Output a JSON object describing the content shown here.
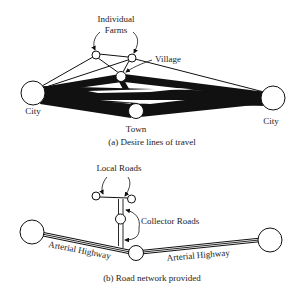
{
  "figure_a": {
    "caption": "(a) Desire lines of travel",
    "labels": {
      "individual_line1": "Individual",
      "individual_line2": "Farms",
      "village": "Village",
      "city_left": "City",
      "city_right": "City",
      "town": "Town"
    }
  },
  "figure_b": {
    "caption": "(b) Road network provided",
    "labels": {
      "local_roads": "Local Roads",
      "collector_roads": "Collector Roads",
      "arterial_left": "Arterial Highway",
      "arterial_right": "Arterial Highway"
    }
  },
  "colors": {
    "ink": "#111111",
    "background": "#ffffff"
  }
}
